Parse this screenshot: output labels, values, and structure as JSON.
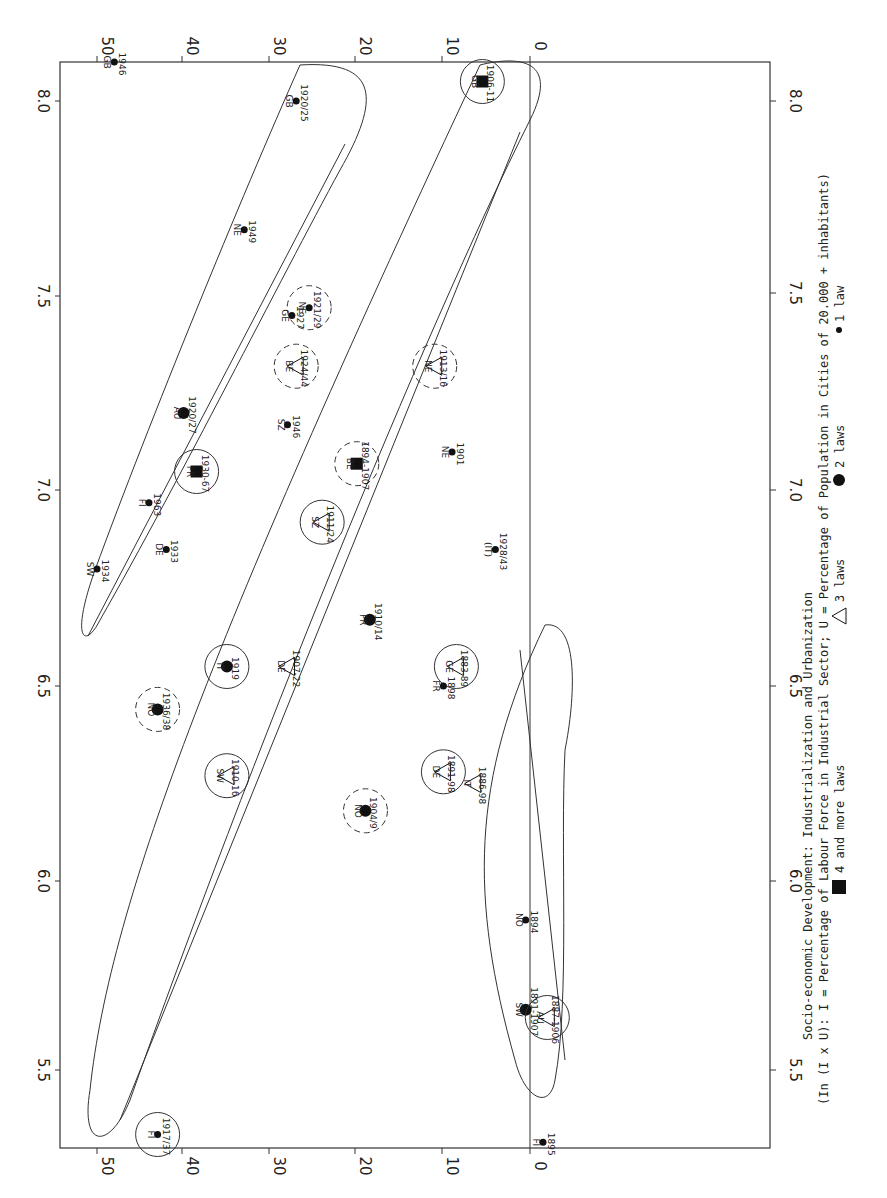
{
  "figure": {
    "orientation": "rotated 90 degrees clockwise",
    "title_line1": "Socio-economic Development: Industrialization and Urbanization",
    "title_line2": "(In (I x U): I = Percentage of Labour Force in Industrial Sector; U = Percentage of Population in Cities of 20.000 + inhabitants)",
    "legend": [
      {
        "symbol": "square",
        "label": "4 and more laws"
      },
      {
        "symbol": "triangle",
        "label": "3 laws"
      },
      {
        "symbol": "large-dot",
        "label": "2 laws"
      },
      {
        "symbol": "dot",
        "label": "1 law"
      }
    ]
  },
  "chart_data": {
    "type": "scatter",
    "title": "Socio-economic Development: Industrialization and Urbanization",
    "xlabel": "In (I x U)",
    "ylabel": "Percentage",
    "x_ticks": [
      "5.5",
      "6.0",
      "6.5",
      "7.0",
      "7.5",
      "8.0"
    ],
    "y_ticks": [
      "0",
      "10",
      "20",
      "30",
      "40",
      "50"
    ],
    "xlim": [
      5.4,
      8.1
    ],
    "ylim": [
      -3,
      55
    ],
    "grid": false,
    "legend_position": "below",
    "points": [
      {
        "country": "GB",
        "year": "1946",
        "x": 8.1,
        "y": 48,
        "laws": 1,
        "circle": "none"
      },
      {
        "country": "GB",
        "year": "1920/25",
        "x": 8.0,
        "y": 27,
        "laws": 1,
        "circle": "none"
      },
      {
        "country": "NE",
        "year": "1949",
        "x": 7.67,
        "y": 33,
        "laws": 1,
        "circle": "none"
      },
      {
        "country": "GE",
        "year": "1927",
        "x": 7.45,
        "y": 27.5,
        "laws": 1,
        "circle": "none"
      },
      {
        "country": "BE",
        "year": "1924/44",
        "x": 7.32,
        "y": 27,
        "laws": 3,
        "circle": "dashed"
      },
      {
        "country": "AU",
        "year": "1920/27",
        "x": 7.2,
        "y": 40,
        "laws": 2,
        "circle": "none"
      },
      {
        "country": "FR",
        "year": "1930-67",
        "x": 7.05,
        "y": 38.5,
        "laws": 4,
        "circle": "solid"
      },
      {
        "country": "FI",
        "year": "1963",
        "x": 6.97,
        "y": 44,
        "laws": 1,
        "circle": "none"
      },
      {
        "country": "DE",
        "year": "1933",
        "x": 6.85,
        "y": 42,
        "laws": 1,
        "circle": "none"
      },
      {
        "country": "SW",
        "year": "1934",
        "x": 6.8,
        "y": 50,
        "laws": 1,
        "circle": "none"
      },
      {
        "country": "NE",
        "year": "1921/29",
        "x": 7.47,
        "y": 25.5,
        "laws": 1,
        "circle": "dashed"
      },
      {
        "country": "SZ",
        "year": "1946",
        "x": 7.17,
        "y": 28,
        "laws": 1,
        "circle": "none"
      },
      {
        "country": "NE",
        "year": "1913/16",
        "x": 7.32,
        "y": 11,
        "laws": 3,
        "circle": "dashed"
      },
      {
        "country": "BE",
        "year": "1894-1907",
        "x": 7.07,
        "y": 20,
        "laws": 4,
        "circle": "dashed"
      },
      {
        "country": "NE",
        "year": "1901",
        "x": 7.1,
        "y": 9,
        "laws": 1,
        "circle": "none"
      },
      {
        "country": "SZ",
        "year": "1911/24",
        "x": 6.92,
        "y": 24,
        "laws": 3,
        "circle": "solid"
      },
      {
        "country": "(IT)",
        "year": "1928/43",
        "x": 6.85,
        "y": 4,
        "laws": 1,
        "circle": "none"
      },
      {
        "country": "FR",
        "year": "1910/14",
        "x": 6.67,
        "y": 18.5,
        "laws": 2,
        "circle": "none"
      },
      {
        "country": "IT",
        "year": "1919",
        "x": 6.55,
        "y": 35,
        "laws": 2,
        "circle": "solid"
      },
      {
        "country": "DE",
        "year": "1907-22",
        "x": 6.55,
        "y": 28,
        "laws": 3,
        "circle": "none"
      },
      {
        "country": "NO",
        "year": "1936/38",
        "x": 6.44,
        "y": 43,
        "laws": 2,
        "circle": "dashed"
      },
      {
        "country": "SW",
        "year": "1910-16",
        "x": 6.27,
        "y": 35,
        "laws": 3,
        "circle": "solid"
      },
      {
        "country": "NO",
        "year": "1904/9",
        "x": 6.18,
        "y": 19,
        "laws": 2,
        "circle": "dashed"
      },
      {
        "country": "GE",
        "year": "1883-89",
        "x": 6.55,
        "y": 8.5,
        "laws": 3,
        "circle": "solid"
      },
      {
        "country": "FR",
        "year": "1898",
        "x": 6.5,
        "y": 10,
        "laws": 1,
        "circle": "none"
      },
      {
        "country": "DE",
        "year": "1891-98",
        "x": 6.28,
        "y": 10,
        "laws": 3,
        "circle": "solid"
      },
      {
        "country": "IT",
        "year": "1886-98",
        "x": 6.25,
        "y": 6.5,
        "laws": 3,
        "circle": "none"
      },
      {
        "country": "NO",
        "year": "1894",
        "x": 5.9,
        "y": 0.5,
        "laws": 1,
        "circle": "none"
      },
      {
        "country": "SW",
        "year": "1891-1907",
        "x": 5.67,
        "y": 0.5,
        "laws": 2,
        "circle": "none"
      },
      {
        "country": "AU",
        "year": "1887-1906",
        "x": 5.65,
        "y": -2,
        "laws": 3,
        "circle": "solid"
      },
      {
        "country": "FI",
        "year": "1895",
        "x": 5.33,
        "y": -1.5,
        "laws": 1,
        "circle": "none"
      },
      {
        "country": "FI",
        "year": "1917/37",
        "x": 5.35,
        "y": 43,
        "laws": 1,
        "circle": "solid"
      },
      {
        "country": "GB",
        "year": "1906-11",
        "x": 8.05,
        "y": 5.5,
        "laws": 4,
        "circle": "solid"
      }
    ],
    "clusters": [
      {
        "name": "upper-ellipse",
        "description": "post-1920 group, high industrialization"
      },
      {
        "name": "middle-ellipse",
        "description": "1900-1930 group from FI 1917/37 to GB 1906-11"
      },
      {
        "name": "lower-ellipse",
        "description": "1880-1900 group"
      }
    ]
  }
}
